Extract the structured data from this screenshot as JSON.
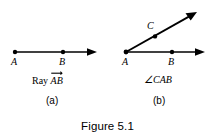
{
  "figure": {
    "caption": "Figure 5.1",
    "background_color": "#ffffff",
    "ink_color": "#000000"
  },
  "panels": [
    {
      "id": "a",
      "sublabel": "(a)",
      "caption_prefix": "Ray ",
      "caption_vector": "AB",
      "caption_full": "Ray AB",
      "notation": "overrightarrow",
      "points": [
        {
          "name": "A",
          "label": "A",
          "x": 15,
          "y": 52
        },
        {
          "name": "B",
          "label": "B",
          "x": 63,
          "y": 52
        }
      ],
      "rays": [
        {
          "name": "ray-AB",
          "from": "A",
          "x1": 15,
          "y1": 52,
          "x2": 97,
          "y2": 52,
          "arrowhead": true
        }
      ]
    },
    {
      "id": "b",
      "sublabel": "(b)",
      "caption_prefix": "",
      "caption_vector": "∠CAB",
      "caption_full": "∠CAB",
      "notation": "angle",
      "points": [
        {
          "name": "A",
          "label": "A",
          "x": 126,
          "y": 52
        },
        {
          "name": "B",
          "label": "B",
          "x": 172,
          "y": 52
        },
        {
          "name": "C",
          "label": "C",
          "x": 155,
          "y": 36
        }
      ],
      "rays": [
        {
          "name": "ray-AB",
          "from": "A",
          "x1": 126,
          "y1": 52,
          "x2": 205,
          "y2": 52,
          "arrowhead": true
        },
        {
          "name": "ray-AC",
          "from": "A",
          "x1": 126,
          "y1": 52,
          "x2": 197,
          "y2": 12,
          "arrowhead": true
        }
      ]
    }
  ]
}
